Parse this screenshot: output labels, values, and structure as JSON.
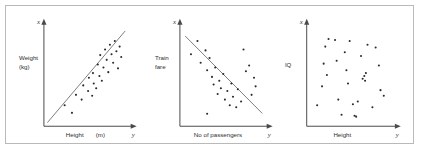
{
  "figure": {
    "panel_border_color": "#b9b9b9",
    "background_color": "#ffffff",
    "axis_color": "#4a4a4a",
    "point_color": "#2b2b2b",
    "trend_color": "#7d7d7d"
  },
  "axis_tags": {
    "vertical": "x",
    "horizontal": "y"
  },
  "chart_data": [
    {
      "type": "scatter",
      "title": "",
      "ylabel": "Weight",
      "ylabel_unit": "(kg)",
      "xlabel": "Height",
      "xlabel_unit": "(m)",
      "correlation": "positive",
      "grid": false,
      "legend": "none",
      "xlim": [
        0,
        100
      ],
      "ylim": [
        0,
        100
      ],
      "trend_line": {
        "x1": 4,
        "y1": 4,
        "x2": 92,
        "y2": 92
      },
      "points": [
        [
          22,
          18
        ],
        [
          31,
          10
        ],
        [
          36,
          29
        ],
        [
          43,
          24
        ],
        [
          45,
          39
        ],
        [
          51,
          33
        ],
        [
          52,
          47
        ],
        [
          56,
          28
        ],
        [
          57,
          52
        ],
        [
          58,
          41
        ],
        [
          61,
          36
        ],
        [
          63,
          61
        ],
        [
          65,
          49
        ],
        [
          66,
          71
        ],
        [
          68,
          44
        ],
        [
          70,
          58
        ],
        [
          72,
          77
        ],
        [
          74,
          66
        ],
        [
          76,
          53
        ],
        [
          78,
          82
        ],
        [
          80,
          72
        ],
        [
          82,
          63
        ],
        [
          84,
          86
        ],
        [
          86,
          75
        ],
        [
          88,
          57
        ],
        [
          90,
          80
        ],
        [
          92,
          69
        ]
      ]
    },
    {
      "type": "scatter",
      "title": "",
      "ylabel": "Train",
      "ylabel_unit": "fare",
      "xlabel": "No of passengers",
      "xlabel_unit": "",
      "correlation": "negative",
      "grid": false,
      "legend": "none",
      "xlim": [
        0,
        100
      ],
      "ylim": [
        0,
        100
      ],
      "trend_line": {
        "x1": 6,
        "y1": 88,
        "x2": 94,
        "y2": 12
      },
      "points": [
        [
          10,
          72
        ],
        [
          18,
          86
        ],
        [
          22,
          63
        ],
        [
          28,
          76
        ],
        [
          30,
          55
        ],
        [
          33,
          68
        ],
        [
          36,
          48
        ],
        [
          38,
          40
        ],
        [
          40,
          58
        ],
        [
          43,
          30
        ],
        [
          45,
          44
        ],
        [
          47,
          36
        ],
        [
          50,
          51
        ],
        [
          52,
          24
        ],
        [
          55,
          33
        ],
        [
          58,
          18
        ],
        [
          60,
          41
        ],
        [
          62,
          27
        ],
        [
          66,
          16
        ],
        [
          68,
          35
        ],
        [
          72,
          22
        ],
        [
          75,
          77
        ],
        [
          78,
          54
        ],
        [
          82,
          60
        ],
        [
          85,
          29
        ],
        [
          88,
          47
        ],
        [
          30,
          9
        ],
        [
          90,
          38
        ]
      ]
    },
    {
      "type": "scatter",
      "title": "",
      "ylabel": "IQ",
      "ylabel_unit": "",
      "xlabel": "Height",
      "xlabel_unit": "",
      "correlation": "none",
      "grid": false,
      "legend": "none",
      "xlim": [
        0,
        100
      ],
      "ylim": [
        0,
        100
      ],
      "trend_line": null,
      "points": [
        [
          8,
          18
        ],
        [
          14,
          38
        ],
        [
          16,
          62
        ],
        [
          18,
          80
        ],
        [
          20,
          50
        ],
        [
          22,
          88
        ],
        [
          30,
          87
        ],
        [
          32,
          65
        ],
        [
          34,
          24
        ],
        [
          38,
          8
        ],
        [
          42,
          74
        ],
        [
          44,
          55
        ],
        [
          46,
          41
        ],
        [
          48,
          86
        ],
        [
          52,
          19
        ],
        [
          54,
          7
        ],
        [
          56,
          6
        ],
        [
          58,
          22
        ],
        [
          62,
          70
        ],
        [
          64,
          46
        ],
        [
          66,
          49
        ],
        [
          67,
          44
        ],
        [
          68,
          52
        ],
        [
          70,
          82
        ],
        [
          76,
          16
        ],
        [
          80,
          79
        ],
        [
          84,
          60
        ],
        [
          86,
          34
        ],
        [
          90,
          28
        ]
      ]
    }
  ]
}
